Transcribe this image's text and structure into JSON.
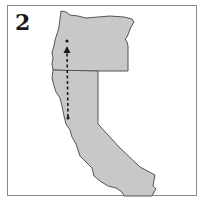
{
  "figure": {
    "panel_label": "2",
    "regions": [
      {
        "name": "Oregon",
        "fill": "#c8c8c8"
      },
      {
        "name": "California",
        "fill": "#c8c8c8"
      }
    ],
    "route": {
      "style": "dashed",
      "direction": "north",
      "start": "Northern California coast",
      "end": "Western Oregon",
      "color": "#1a1a1a"
    },
    "colors": {
      "border": "#8a8a8a",
      "state_fill": "#c8c8c8",
      "state_outline": "#555555",
      "background": "#ffffff"
    }
  }
}
